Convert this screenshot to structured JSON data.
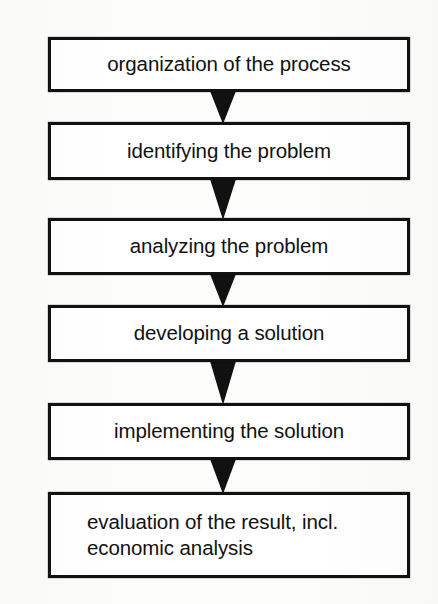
{
  "diagram": {
    "type": "flowchart",
    "orientation": "vertical",
    "background_color": "#fcfcfa",
    "stroke_color": "#111111",
    "fill_color": "#ffffff",
    "nodes": [
      {
        "id": "node-1",
        "label": "organization of the process",
        "align": "center",
        "x": 48,
        "y": 37,
        "width": 362,
        "height": 55
      },
      {
        "id": "node-2",
        "label": "identifying the problem",
        "align": "center",
        "x": 48,
        "y": 122,
        "width": 362,
        "height": 58
      },
      {
        "id": "node-3",
        "label": "analyzing the problem",
        "align": "center",
        "x": 48,
        "y": 218,
        "width": 362,
        "height": 57
      },
      {
        "id": "node-4",
        "label": "developing a solution",
        "align": "center",
        "x": 48,
        "y": 305,
        "width": 362,
        "height": 57
      },
      {
        "id": "node-5",
        "label": "implementing the solution",
        "align": "center",
        "x": 48,
        "y": 403,
        "width": 362,
        "height": 57
      },
      {
        "id": "node-6",
        "label": "evaluation of the result, incl.\neconomic analysis",
        "align": "left",
        "x": 48,
        "y": 492,
        "width": 362,
        "height": 86
      }
    ],
    "connectors": [
      {
        "id": "arrow-1",
        "from": "node-1",
        "to": "node-2",
        "shape": "filled-triangle-down",
        "x": 223,
        "y": 90,
        "width": 28,
        "height": 34
      },
      {
        "id": "arrow-2",
        "from": "node-2",
        "to": "node-3",
        "shape": "filled-triangle-down",
        "x": 223,
        "y": 178,
        "width": 28,
        "height": 42
      },
      {
        "id": "arrow-3",
        "from": "node-3",
        "to": "node-4",
        "shape": "filled-triangle-down",
        "x": 223,
        "y": 273,
        "width": 28,
        "height": 34
      },
      {
        "id": "arrow-4",
        "from": "node-4",
        "to": "node-5",
        "shape": "filled-triangle-down",
        "x": 223,
        "y": 360,
        "width": 28,
        "height": 45
      },
      {
        "id": "arrow-5",
        "from": "node-5",
        "to": "node-6",
        "shape": "filled-triangle-down",
        "x": 223,
        "y": 458,
        "width": 28,
        "height": 36
      }
    ]
  }
}
